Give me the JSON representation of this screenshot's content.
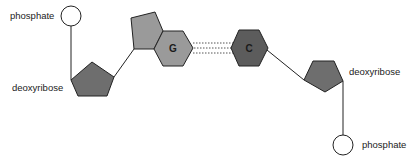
{
  "diagram": {
    "labels": {
      "phosphate_top": "phosphate",
      "deoxyribose_left": "deoxyribose",
      "base_g": "G",
      "base_c": "C",
      "deoxyribose_right": "deoxyribose",
      "phosphate_bottom": "phosphate"
    },
    "colors": {
      "phosphate_fill": "#ffffff",
      "deoxyribose_fill": "#6e6e6e",
      "guanine_fill": "#9a9a9a",
      "cytosine_fill": "#5c5c5c",
      "stroke": "#222222",
      "hydrogen_bond": "#555555"
    },
    "hydrogen_bond_count": 3
  }
}
